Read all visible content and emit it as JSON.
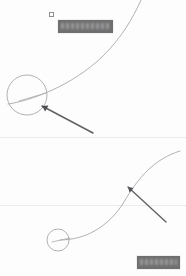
{
  "canvas": {
    "width": 186,
    "height": 276,
    "background_color": "#fdfdfd"
  },
  "palette": {
    "curve_stroke": "#a9a9ad",
    "circle_stroke": "#a9a9ad",
    "arrow_stroke": "#636366",
    "label_fill": "#6f6f70",
    "marker_stroke": "#8e8e90",
    "rule_color": "#c8c8cc"
  },
  "panels": [
    {
      "id": "upper",
      "name": "upper-panel",
      "curve": {
        "name": "upper-curve",
        "description": "thin gray curve rising to the upper right",
        "path": "M 8 104 C 30 101, 72 86, 103 56 C 122 37, 133 18, 141 0",
        "stroke": "#a9a9ad",
        "stroke_width": 0.9
      },
      "annotation_circle": {
        "name": "upper-annotation-circle",
        "cx": 27,
        "cy": 95,
        "r": 20,
        "stroke": "#a9a9ad",
        "stroke_width": 0.9
      },
      "leader_line": {
        "name": "upper-circle-leader-line",
        "x1": 19,
        "y1": 101,
        "x2": 46,
        "y2": 93
      },
      "arrow": {
        "name": "upper-arrow",
        "tail_x": 93,
        "tail_y": 133,
        "head_x": 42,
        "head_y": 106,
        "stroke": "#636366",
        "stroke_width": 1.6
      },
      "label": {
        "name": "upper-label",
        "text": "",
        "redacted": true,
        "x": 58,
        "y": 20,
        "width": 55,
        "height": 13,
        "fill": "#6f6f70"
      },
      "marker": {
        "name": "upper-square-marker",
        "x": 49,
        "y": 12,
        "size": 3
      }
    },
    {
      "id": "lower",
      "name": "lower-panel",
      "curve": {
        "name": "lower-curve",
        "description": "thin gray S-curve rising from lower left to upper right",
        "path": "M 60 240 C 84 240, 108 228, 124 202 C 138 178, 154 159, 180 151",
        "stroke": "#a9a9ad",
        "stroke_width": 0.9
      },
      "annotation_circle": {
        "name": "lower-annotation-circle",
        "cx": 58,
        "cy": 240,
        "r": 11,
        "stroke": "#a9a9ad",
        "stroke_width": 0.9
      },
      "leader_line": {
        "name": "lower-circle-leader-line",
        "x1": 52,
        "y1": 242,
        "x2": 70,
        "y2": 238
      },
      "arrow": {
        "name": "lower-arrow",
        "tail_x": 166,
        "tail_y": 222,
        "head_x": 128,
        "head_y": 187,
        "stroke": "#636366",
        "stroke_width": 1.4
      },
      "label": {
        "name": "lower-label",
        "text": "",
        "redacted": true,
        "x": 137,
        "y": 256,
        "width": 43,
        "height": 13,
        "fill": "#6f6f70"
      }
    }
  ],
  "rules": [
    {
      "name": "faint-rule-upper",
      "y": 137
    },
    {
      "name": "faint-rule-lower",
      "y": 205
    }
  ]
}
